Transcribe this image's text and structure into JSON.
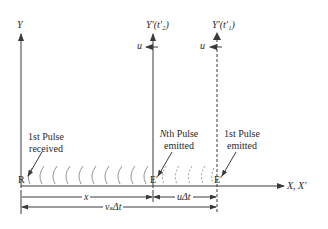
{
  "diagram": {
    "axes": {
      "y_label": "Y",
      "y_prime_t2_label": "Y′(t′₂)",
      "y_prime_t1_label": "Y′(t′₁)",
      "x_label": "X, X′"
    },
    "velocity_labels": {
      "u_at_t2": "u",
      "u_at_t1": "u"
    },
    "points": {
      "receiver": "R",
      "emitter_nth": "E′",
      "emitter_first": "E′"
    },
    "annotations": {
      "first_pulse_received_line1": "1st Pulse",
      "first_pulse_received_line2": "received",
      "nth_pulse_emitted_line1": "Nth Pulse",
      "nth_pulse_emitted_line2": "emitted",
      "first_pulse_emitted_line1": "1st Pulse",
      "first_pulse_emitted_line2": "emitted"
    },
    "dimensions": {
      "x": "x",
      "u_delta_t": "uΔt",
      "vs_delta_t": "vₛΔt"
    },
    "colors": {
      "line": "#3a3a3a",
      "wavefront": "#8a8a8a",
      "text": "#2a2a2a",
      "background": "#ffffff"
    }
  }
}
